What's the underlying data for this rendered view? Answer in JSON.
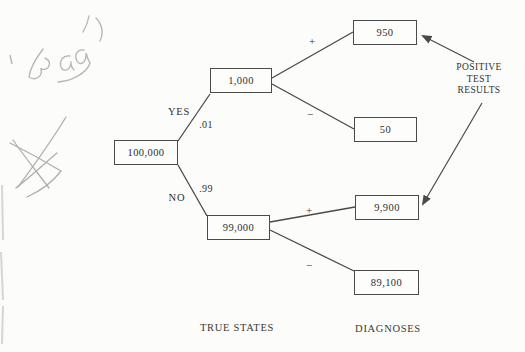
{
  "handwriting": {
    "word": "Bay's",
    "scribble": "pencil-x-scribble"
  },
  "tree": {
    "root": "100,000",
    "yes_node": "1,000",
    "no_node": "99,000",
    "yes_pos": "950",
    "yes_neg": "50",
    "no_pos": "9,900",
    "no_neg": "89,100",
    "yes_label": "YES",
    "yes_prob": ".01",
    "no_label": "NO",
    "no_prob": ".99",
    "plus": "+",
    "minus": "−"
  },
  "annotations": {
    "positive_line1": "POSITIVE",
    "positive_line2": "TEST",
    "positive_line3": "RESULTS",
    "true_states": "TRUE STATES",
    "diagnoses": "DIAGNOSES"
  },
  "colors": {
    "ink": "#4a4a4a",
    "text": "#2e2e2e",
    "pencil": "#b7b5b1",
    "background": "#fcfcfb"
  }
}
